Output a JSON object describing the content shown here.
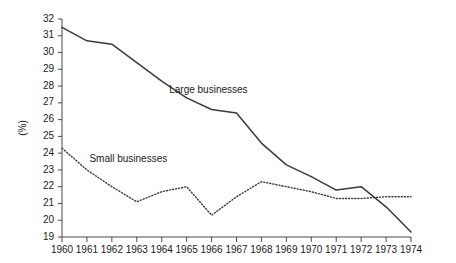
{
  "chart_data": {
    "type": "line",
    "title": "",
    "xlabel": "",
    "ylabel": "(%)",
    "x": [
      1960,
      1961,
      1962,
      1963,
      1964,
      1965,
      1966,
      1967,
      1968,
      1969,
      1970,
      1971,
      1972,
      1973,
      1974
    ],
    "categories": [
      "1960",
      "1961",
      "1962",
      "1963",
      "1964",
      "1965",
      "1966",
      "1967",
      "1968",
      "1969",
      "1970",
      "1971",
      "1972",
      "1973",
      "1974"
    ],
    "xlim": [
      1960,
      1974
    ],
    "ylim": [
      19,
      32
    ],
    "y_ticks": [
      19,
      20,
      21,
      22,
      23,
      24,
      25,
      26,
      27,
      28,
      29,
      30,
      31,
      32
    ],
    "y_tick_labels": [
      "19",
      "20",
      "21",
      "22",
      "23",
      "24",
      "25",
      "26",
      "27",
      "28",
      "29",
      "30",
      "31",
      "32"
    ],
    "grid": false,
    "legend_position": "inline-annotation",
    "series": [
      {
        "name": "Large businesses",
        "style": "solid",
        "color": "#3a3a3a",
        "label_x": 1964.3,
        "label_y": 27.6,
        "values": [
          31.5,
          30.7,
          30.5,
          29.4,
          28.3,
          27.3,
          26.6,
          26.4,
          24.6,
          23.3,
          22.6,
          21.8,
          22.0,
          20.8,
          19.3
        ]
      },
      {
        "name": "Small businesses",
        "style": "dotted",
        "color": "#3a3a3a",
        "label_x": 1961.1,
        "label_y": 23.5,
        "values": [
          24.3,
          23.0,
          22.0,
          21.1,
          21.7,
          22.0,
          20.3,
          21.4,
          22.3,
          22.0,
          21.7,
          21.3,
          21.3,
          21.4,
          21.4
        ]
      }
    ]
  }
}
